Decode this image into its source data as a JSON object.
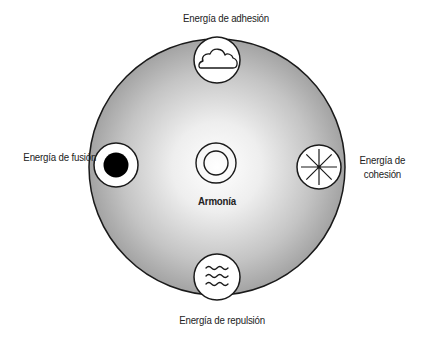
{
  "diagram": {
    "center": {
      "label": "Armonía",
      "icon": "double-ring-icon"
    },
    "nodes": [
      {
        "position": "top",
        "label": "Energía de adhesión",
        "icon": "cloud-icon"
      },
      {
        "position": "left",
        "label": "Energía de fusión",
        "icon": "filled-dot-icon"
      },
      {
        "position": "right",
        "label_line1": "Energía de",
        "label_line2": "cohesión",
        "icon": "asterisk-star-icon"
      },
      {
        "position": "bottom",
        "label": "Energía de repulsión",
        "icon": "waves-icon"
      }
    ],
    "colors": {
      "disc_center": "#ffffff",
      "disc_edge": "#9a9a9a",
      "stroke": "#1a1a1a",
      "text": "#222222"
    }
  }
}
